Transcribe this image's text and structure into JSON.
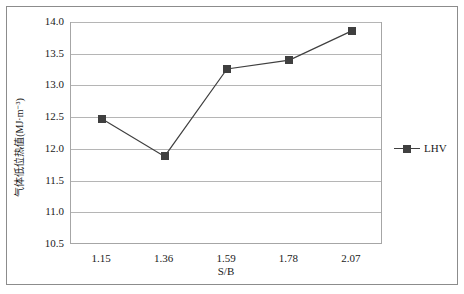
{
  "chart_data": {
    "type": "line",
    "title": "",
    "xlabel": "S/B",
    "ylabel": "气体低位热值(MJ·m⁻³)",
    "categories": [
      "1.15",
      "1.36",
      "1.59",
      "1.78",
      "2.07"
    ],
    "x_values": [
      1.15,
      1.36,
      1.59,
      1.78,
      2.07
    ],
    "ylim": [
      10.5,
      14.0
    ],
    "ytick_labels": [
      "14.0",
      "13.5",
      "13.0",
      "12.5",
      "12.0",
      "11.5",
      "11.0",
      "10.5"
    ],
    "ytick_values": [
      14.0,
      13.5,
      13.0,
      12.5,
      12.0,
      11.5,
      11.0,
      10.5
    ],
    "grid": true,
    "legend_position": "right",
    "series": [
      {
        "name": "LHV",
        "color": "#3f3f3f",
        "marker": "square",
        "values": [
          12.47,
          11.88,
          13.26,
          13.4,
          13.86
        ]
      }
    ]
  },
  "legend": {
    "label": "LHV"
  },
  "axes": {
    "x_title": "S/B",
    "y_title": "气体低位热值(MJ·m⁻³)"
  }
}
